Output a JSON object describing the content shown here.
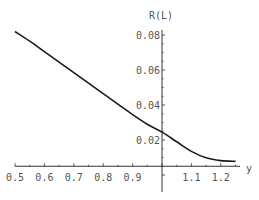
{
  "chart_data": {
    "type": "line",
    "title": "",
    "xlabel": "y",
    "ylabel": "R(L)",
    "xlim": [
      0.5,
      1.25
    ],
    "ylim": [
      0.005,
      0.085
    ],
    "axes_origin": [
      1.0,
      0.005
    ],
    "grid": false,
    "legend": null,
    "x_ticks": [
      "0.5",
      "0.6",
      "0.7",
      "0.8",
      "0.9",
      "1.1",
      "1.2"
    ],
    "y_ticks": [
      "0.02",
      "0.04",
      "0.06",
      "0.08"
    ],
    "series": [
      {
        "name": "R(L)",
        "x": [
          0.5,
          0.55,
          0.6,
          0.65,
          0.7,
          0.75,
          0.8,
          0.85,
          0.9,
          0.95,
          1.0,
          1.05,
          1.1,
          1.15,
          1.2,
          1.25
        ],
        "values": [
          0.082,
          0.0765,
          0.0705,
          0.0645,
          0.0585,
          0.0525,
          0.0465,
          0.0405,
          0.0345,
          0.029,
          0.0245,
          0.019,
          0.0135,
          0.0098,
          0.0082,
          0.0078
        ]
      }
    ]
  }
}
